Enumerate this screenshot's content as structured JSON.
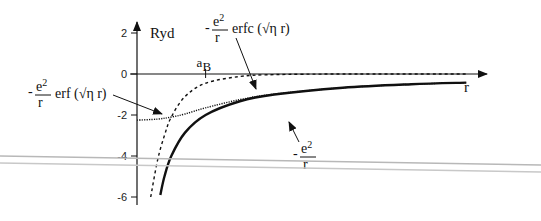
{
  "chart_data": {
    "type": "line",
    "title": "",
    "xlabel": "r",
    "ylabel": "Ryd",
    "ylim": [
      -6,
      2
    ],
    "yticks": [
      2,
      0,
      -2,
      -4,
      -6
    ],
    "ytick_labels": [
      "2",
      "0",
      "-2",
      "-4",
      "-6"
    ],
    "x_marker": {
      "label": "a",
      "subscript": "B",
      "x": 1
    },
    "xlim": [
      0,
      5
    ],
    "series": [
      {
        "name": "-e²/r",
        "style": "solid",
        "label": {
          "prefix": "-",
          "num": "e",
          "sup": "2",
          "den": "r",
          "suffix": ""
        },
        "x": [
          0.34,
          0.4,
          0.5,
          0.7,
          1.0,
          1.5,
          2.0,
          3.0,
          4.0,
          4.8
        ],
        "y": [
          -5.9,
          -5.0,
          -4.0,
          -2.86,
          -2.0,
          -1.33,
          -1.0,
          -0.67,
          -0.5,
          -0.42
        ]
      },
      {
        "name": "-e²/r erfc(√η r)",
        "style": "dashed",
        "label": {
          "prefix": "-",
          "num": "e",
          "sup": "2",
          "den": "r",
          "suffix": "erfc (√η r)"
        },
        "x": [
          0.2,
          0.3,
          0.4,
          0.5,
          0.7,
          1.0,
          1.5,
          2.0,
          3.0,
          4.8
        ],
        "y": [
          -6.0,
          -4.2,
          -3.0,
          -2.1,
          -1.1,
          -0.45,
          -0.12,
          -0.03,
          0.0,
          0.0
        ]
      },
      {
        "name": "-e²/r erf(√η r)",
        "style": "dotted",
        "label": {
          "prefix": "-",
          "num": "e",
          "sup": "2",
          "den": "r",
          "suffix": "erf (√η r)"
        },
        "x": [
          0.0,
          0.3,
          0.5,
          0.7,
          1.0,
          1.5,
          2.0,
          3.0,
          4.0,
          4.8
        ],
        "y": [
          -2.25,
          -2.2,
          -2.1,
          -1.95,
          -1.65,
          -1.25,
          -0.98,
          -0.67,
          -0.5,
          -0.42
        ]
      }
    ],
    "grid": false,
    "legend": "none"
  },
  "colors": {
    "ink": "#111111",
    "overlay_line": "#b8b8b8"
  }
}
